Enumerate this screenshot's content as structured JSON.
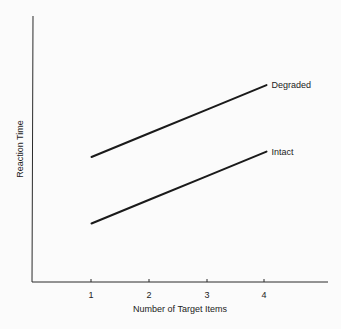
{
  "chart_data": {
    "type": "line",
    "title": "",
    "xlabel": "Number of Target Items",
    "ylabel": "Reaction Time",
    "x": [
      1,
      2,
      3,
      4
    ],
    "x_ticks": [
      "1",
      "2",
      "3",
      "4"
    ],
    "y_ticks": [],
    "ylim": [
      0,
      100
    ],
    "xlim": [
      0,
      4.75
    ],
    "grid": false,
    "legend": "inline labels at line ends",
    "series": [
      {
        "name": "Degraded",
        "values": [
          47,
          56,
          65,
          74
        ]
      },
      {
        "name": "Intact",
        "values": [
          22,
          31,
          40,
          49
        ]
      }
    ],
    "colors": {
      "line": "#1a1a1a",
      "axis": "#2a2a2a",
      "background": "#fbfbfb"
    }
  }
}
